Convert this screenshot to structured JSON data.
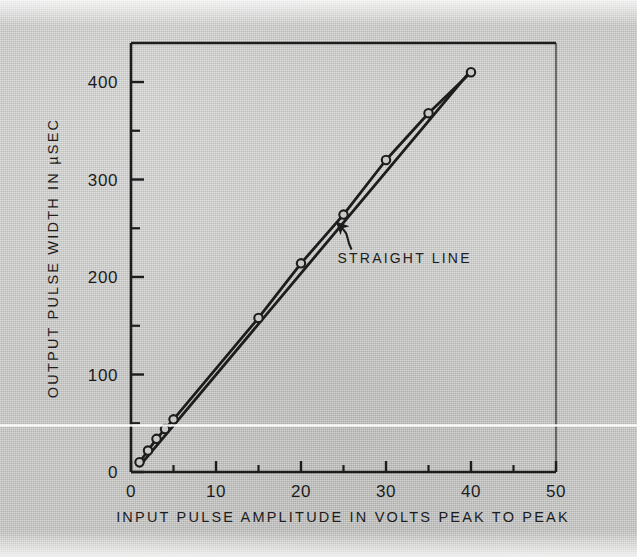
{
  "figure": {
    "background_color": "#c9c9c7",
    "ink_color": "#1d1d1d"
  },
  "axes": {
    "x": {
      "title": "INPUT PULSE AMPLITUDE IN VOLTS PEAK TO PEAK",
      "tick_labels": [
        "0",
        "10",
        "20",
        "30",
        "40",
        "50"
      ],
      "tick_values": [
        0,
        10,
        20,
        30,
        40,
        50
      ],
      "minor_tick_values": [
        5,
        15,
        25,
        35,
        45
      ],
      "min": 0,
      "max": 50
    },
    "y": {
      "title": "OUTPUT PULSE WIDTH IN µSEC",
      "tick_labels": [
        "0",
        "100",
        "200",
        "300",
        "400"
      ],
      "tick_values": [
        0,
        100,
        200,
        300,
        400
      ],
      "minor_tick_values": [
        50,
        150,
        250,
        350
      ],
      "min": 0,
      "max": 440
    }
  },
  "annotations": [
    {
      "name": "straight-line-callout",
      "text": "STRAIGHT LINE",
      "text_x": 24.3,
      "text_y": 218,
      "arrow_tip_x": 24.2,
      "arrow_tip_y": 256
    }
  ],
  "chart_data": {
    "type": "line",
    "title": "",
    "subtitle": "",
    "xlabel": "INPUT PULSE AMPLITUDE IN VOLTS PEAK TO PEAK",
    "ylabel": "OUTPUT PULSE WIDTH IN µSEC",
    "xlim": [
      0,
      50
    ],
    "ylim": [
      0,
      440
    ],
    "grid": false,
    "legend": "none",
    "series": [
      {
        "name": "Measured output pulse width",
        "marker": "open-circle",
        "x": [
          1,
          2,
          3,
          4,
          5,
          15,
          20,
          25,
          30,
          35,
          40
        ],
        "values": [
          10,
          22,
          34,
          44,
          54,
          158,
          214,
          264,
          320,
          368,
          410
        ]
      },
      {
        "name": "STRAIGHT LINE",
        "marker": "none",
        "x": [
          1,
          40
        ],
        "values": [
          6,
          412
        ]
      }
    ]
  }
}
